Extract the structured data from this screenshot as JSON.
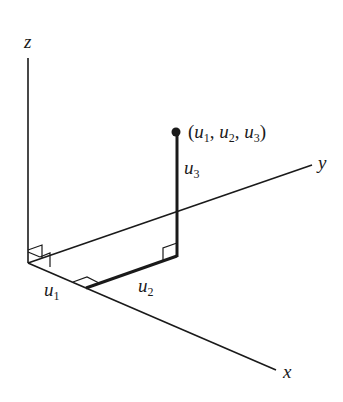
{
  "diagram": {
    "type": "3d-coordinate-axes",
    "axes": {
      "x": {
        "label": "x"
      },
      "y": {
        "label": "y"
      },
      "z": {
        "label": "z"
      }
    },
    "point": {
      "label_open": "(",
      "u1": "u",
      "u1_sub": "1",
      "sep1": ", ",
      "u2": "u",
      "u2_sub": "2",
      "sep2": ", ",
      "u3": "u",
      "u3_sub": "3",
      "label_close": ")"
    },
    "segments": {
      "u1": {
        "var": "u",
        "sub": "1"
      },
      "u2": {
        "var": "u",
        "sub": "2"
      },
      "u3": {
        "var": "u",
        "sub": "3"
      }
    },
    "colors": {
      "line": "#1a1a1a",
      "background": "#ffffff"
    }
  }
}
